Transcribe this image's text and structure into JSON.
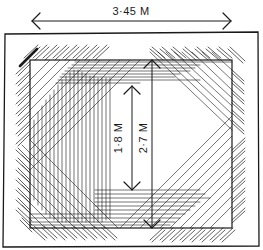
{
  "diagram": {
    "labels": {
      "width_dimension": "3·45 M",
      "inner_height_dimension": "1·8 M",
      "outer_height_dimension": "2·7 M"
    },
    "colors": {
      "ink": "#1a1a1a",
      "background": "#ffffff"
    }
  }
}
